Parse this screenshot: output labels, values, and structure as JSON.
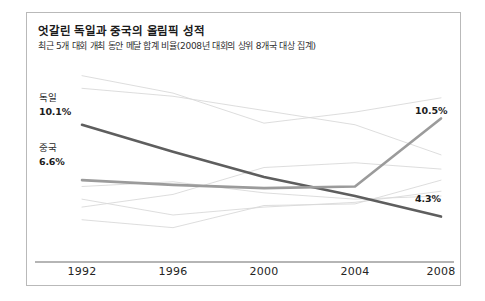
{
  "card": {
    "title": "엇갈린 독일과 중국의 올림픽 성적",
    "subtitle": "최근 5개 대회 개최 동안 메달 합계 비율(2008년 대회의 상위 8개국 대상 집계)"
  },
  "axis": {
    "ticks": [
      "1992",
      "1996",
      "2000",
      "2004",
      "2008"
    ]
  },
  "labels": {
    "germany_name": "독일",
    "germany_start_value": "10.1%",
    "china_name": "중국",
    "china_start_value": "6.6%",
    "china_end_value": "10.5%",
    "germany_end_value": "4.3%"
  },
  "colors": {
    "germany": "#5e5e5e",
    "china": "#9b9b9b",
    "background_series": "#d9d9d9",
    "axis": "#6d6d6d",
    "card_border": "#b9b9b9"
  },
  "chart_data": {
    "type": "line",
    "title": "엇갈린 독일과 중국의 올림픽 성적",
    "subtitle": "최근 5개 대회 개최 동안 메달 합계 비율(2008년 대회의 상위 8개국 대상 집계)",
    "xlabel": "",
    "ylabel": "메달 합계 비율 (%)",
    "categories": [
      "1992",
      "1996",
      "2000",
      "2004",
      "2008"
    ],
    "ylim": [
      2.0,
      14.0
    ],
    "grid": false,
    "legend": "inline-labels",
    "highlight": [
      "독일",
      "중국"
    ],
    "series": [
      {
        "name": "독일",
        "highlight": true,
        "color": "#5e5e5e",
        "values": [
          10.1,
          8.4,
          6.8,
          5.6,
          4.3
        ]
      },
      {
        "name": "중국",
        "highlight": true,
        "color": "#9b9b9b",
        "values": [
          6.6,
          6.3,
          6.1,
          6.2,
          10.5
        ]
      },
      {
        "name": "미국",
        "highlight": false,
        "color": "#d9d9d9",
        "values": [
          13.2,
          12.1,
          10.2,
          10.9,
          11.8
        ]
      },
      {
        "name": "러시아",
        "highlight": false,
        "color": "#d9d9d9",
        "values": [
          12.4,
          11.9,
          11.0,
          10.1,
          8.2
        ]
      },
      {
        "name": "호주",
        "highlight": false,
        "color": "#d9d9d9",
        "values": [
          4.9,
          5.7,
          7.4,
          7.7,
          7.3
        ]
      },
      {
        "name": "영국",
        "highlight": false,
        "color": "#d9d9d9",
        "values": [
          4.1,
          3.6,
          5.0,
          5.1,
          6.6
        ]
      },
      {
        "name": "프랑스",
        "highlight": false,
        "color": "#d9d9d9",
        "values": [
          6.2,
          6.5,
          5.8,
          5.4,
          5.6
        ]
      },
      {
        "name": "한국",
        "highlight": false,
        "color": "#d9d9d9",
        "values": [
          5.4,
          4.4,
          4.9,
          5.2,
          5.9
        ]
      }
    ]
  }
}
